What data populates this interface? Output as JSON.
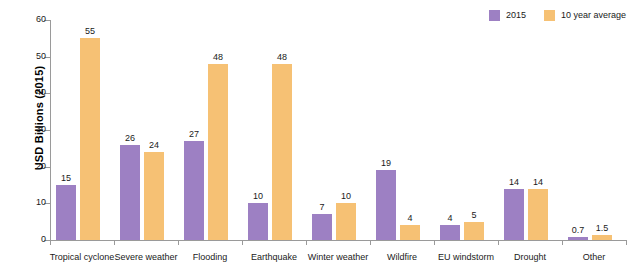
{
  "chart_data": {
    "type": "bar",
    "title": "",
    "subtitle": "",
    "xlabel": "",
    "ylabel": "USD Billions (2015)",
    "ylim": [
      0,
      60
    ],
    "yticks": [
      0,
      10,
      20,
      30,
      40,
      50,
      60
    ],
    "grid": false,
    "legend_position": "top-right",
    "categories": [
      "Tropical cyclone",
      "Severe weather",
      "Flooding",
      "Earthquake",
      "Winter weather",
      "Wildfire",
      "EU windstorm",
      "Drought",
      "Other"
    ],
    "series": [
      {
        "name": "2015",
        "color": "#9d80c3",
        "values": [
          15,
          26,
          27,
          10,
          7,
          19,
          4,
          14,
          0.7
        ],
        "labels": [
          "15",
          "26",
          "27",
          "10",
          "7",
          "19",
          "4",
          "14",
          "0.7"
        ]
      },
      {
        "name": "10 year average",
        "color": "#f6c174",
        "values": [
          55,
          24,
          48,
          48,
          10,
          4,
          5,
          14,
          1.5
        ],
        "labels": [
          "55",
          "24",
          "48",
          "48",
          "10",
          "4",
          "5",
          "14",
          "1.5"
        ]
      }
    ]
  },
  "legend": {
    "items": [
      {
        "label": "2015",
        "color": "#9d80c3"
      },
      {
        "label": "10 year average",
        "color": "#f6c174"
      }
    ]
  },
  "axis": {
    "y_title": "USD Billions (2015)",
    "y_tick_labels": [
      "0",
      "10",
      "20",
      "30",
      "40",
      "50",
      "60"
    ]
  }
}
